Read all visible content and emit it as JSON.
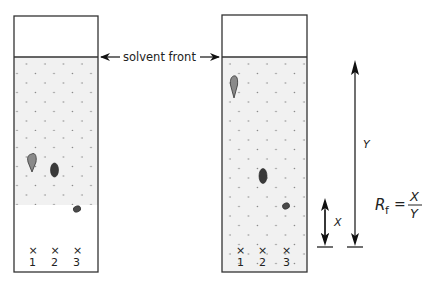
{
  "diagram": {
    "solvent_front_label": "solvent front",
    "plates": [
      {
        "name": "before-separation-plate",
        "origin_labels": [
          "1",
          "2",
          "3"
        ],
        "spots": [
          {
            "lane": 1,
            "shape": "teardrop",
            "color": "#8a8a8a"
          },
          {
            "lane": 2,
            "shape": "oval",
            "color": "#3a3a3a"
          },
          {
            "lane": 3,
            "shape": "small-oval",
            "color": "#4a4a4a"
          }
        ]
      },
      {
        "name": "after-separation-plate",
        "origin_labels": [
          "1",
          "2",
          "3"
        ],
        "spots": [
          {
            "lane": 1,
            "shape": "teardrop",
            "color": "#8a8a8a"
          },
          {
            "lane": 2,
            "shape": "oval",
            "color": "#3a3a3a"
          },
          {
            "lane": 3,
            "shape": "small-oval",
            "color": "#4a4a4a"
          }
        ]
      }
    ],
    "distance_labels": {
      "x": "X",
      "y": "Y"
    },
    "formula": {
      "lhs": "R",
      "subscript": "f",
      "equals": "=",
      "numerator": "X",
      "denominator": "Y"
    },
    "colors": {
      "stroke": "#333333",
      "fill_solvent": "#f1f1f1",
      "dot": "#888888"
    }
  }
}
